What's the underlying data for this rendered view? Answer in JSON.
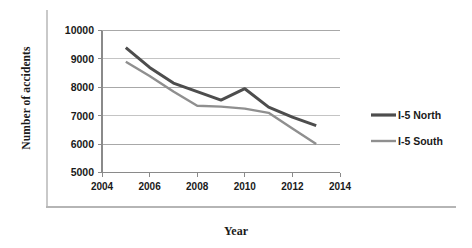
{
  "chart_data": {
    "type": "line",
    "title": "",
    "xlabel": "Year",
    "ylabel": "Number of accidents",
    "x": [
      2005,
      2006,
      2007,
      2008,
      2009,
      2010,
      2011,
      2012,
      2013
    ],
    "xlim": [
      2004,
      2014
    ],
    "ylim": [
      5000,
      10000
    ],
    "xticks": [
      2004,
      2006,
      2008,
      2010,
      2012,
      2014
    ],
    "xtick_labels": [
      "2004",
      "2006",
      "2008",
      "2010",
      "2012",
      "2014"
    ],
    "yticks": [
      5000,
      6000,
      7000,
      8000,
      9000,
      10000
    ],
    "ytick_labels": [
      "5000",
      "6000",
      "7000",
      "8000",
      "9000",
      "10000"
    ],
    "grid": "horizontal",
    "legend_position": "right",
    "series": [
      {
        "name": "I-5 North",
        "color": "#4d4d4d",
        "values": [
          9400,
          8700,
          8150,
          7850,
          7550,
          7950,
          7300,
          6950,
          6650
        ]
      },
      {
        "name": "I-5 South",
        "color": "#8f8f8f",
        "values": [
          8900,
          8400,
          7850,
          7350,
          7320,
          7250,
          7100,
          6550,
          6000
        ]
      }
    ]
  },
  "axis": {
    "x_title": "Year",
    "y_title": "Number of accidents"
  },
  "legend": {
    "entries": [
      {
        "label": "I-5 North",
        "color": "#4d4d4d"
      },
      {
        "label": "I-5 South",
        "color": "#8f8f8f"
      }
    ]
  }
}
